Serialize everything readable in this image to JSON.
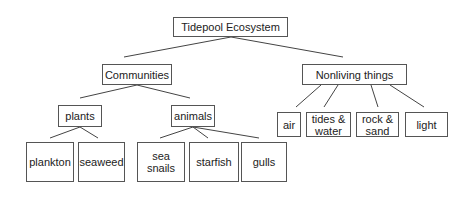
{
  "diagram": {
    "title": "Tidepool Ecosystem",
    "nodes": [
      {
        "id": "root",
        "label": "Tidepool Ecosystem",
        "x": 173,
        "y": 17,
        "w": 115,
        "h": 20
      },
      {
        "id": "communities",
        "label": "Communities",
        "x": 102,
        "y": 64,
        "w": 70,
        "h": 21
      },
      {
        "id": "nonliving",
        "label": "Nonliving things",
        "x": 302,
        "y": 64,
        "w": 105,
        "h": 21
      },
      {
        "id": "plants",
        "label": "plants",
        "x": 58,
        "y": 105,
        "w": 44,
        "h": 22
      },
      {
        "id": "animals",
        "label": "animals",
        "x": 171,
        "y": 105,
        "w": 44,
        "h": 22
      },
      {
        "id": "plankton",
        "label": "plankton",
        "x": 26,
        "y": 142,
        "w": 48,
        "h": 40
      },
      {
        "id": "seaweed",
        "label": "seaweed",
        "x": 78,
        "y": 142,
        "w": 47,
        "h": 40
      },
      {
        "id": "sea-snails",
        "label": "sea\nsnails",
        "x": 137,
        "y": 142,
        "w": 48,
        "h": 40
      },
      {
        "id": "starfish",
        "label": "starfish",
        "x": 189,
        "y": 142,
        "w": 50,
        "h": 40
      },
      {
        "id": "gulls",
        "label": "gulls",
        "x": 241,
        "y": 142,
        "w": 46,
        "h": 40
      },
      {
        "id": "air",
        "label": "air",
        "x": 277,
        "y": 112,
        "w": 24,
        "h": 25
      },
      {
        "id": "tides-water",
        "label": "tides &\nwater",
        "x": 306,
        "y": 112,
        "w": 45,
        "h": 25
      },
      {
        "id": "rock-sand",
        "label": "rock &\nsand",
        "x": 356,
        "y": 112,
        "w": 43,
        "h": 25
      },
      {
        "id": "light",
        "label": "light",
        "x": 405,
        "y": 112,
        "w": 43,
        "h": 25
      }
    ],
    "edges": [
      {
        "from": "root",
        "to": "communities",
        "x1": 231,
        "y1": 37,
        "x2": 124,
        "y2": 57
      },
      {
        "from": "root",
        "to": "nonliving",
        "x1": 231,
        "y1": 37,
        "x2": 343,
        "y2": 57
      },
      {
        "from": "communities",
        "to": "plants",
        "x1": 137,
        "y1": 85,
        "x2": 80,
        "y2": 98
      },
      {
        "from": "communities",
        "to": "animals",
        "x1": 137,
        "y1": 85,
        "x2": 190,
        "y2": 98
      },
      {
        "from": "plants",
        "to": "plankton",
        "x1": 80,
        "y1": 127,
        "x2": 50,
        "y2": 138
      },
      {
        "from": "plants",
        "to": "seaweed",
        "x1": 80,
        "y1": 127,
        "x2": 98,
        "y2": 138
      },
      {
        "from": "animals",
        "to": "sea-snails",
        "x1": 193,
        "y1": 127,
        "x2": 160,
        "y2": 138
      },
      {
        "from": "animals",
        "to": "starfish",
        "x1": 193,
        "y1": 127,
        "x2": 208,
        "y2": 138
      },
      {
        "from": "animals",
        "to": "gulls",
        "x1": 193,
        "y1": 127,
        "x2": 259,
        "y2": 138
      },
      {
        "from": "nonliving",
        "to": "air",
        "x1": 321,
        "y1": 85,
        "x2": 296,
        "y2": 107
      },
      {
        "from": "nonliving",
        "to": "tides-water",
        "x1": 338,
        "y1": 85,
        "x2": 324,
        "y2": 107
      },
      {
        "from": "nonliving",
        "to": "rock-sand",
        "x1": 371,
        "y1": 85,
        "x2": 378,
        "y2": 107
      },
      {
        "from": "nonliving",
        "to": "light",
        "x1": 390,
        "y1": 85,
        "x2": 424,
        "y2": 107
      }
    ],
    "colors": {
      "line": "#444444",
      "border": "#555555",
      "text": "#222222",
      "background": "#ffffff"
    }
  }
}
